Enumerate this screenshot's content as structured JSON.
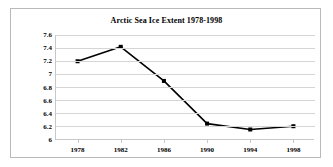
{
  "chart_data": {
    "type": "line",
    "title": "Arctic Sea Ice Extent 1978-1998",
    "xlabel": "",
    "ylabel": "",
    "x": [
      1978,
      1982,
      1986,
      1990,
      1994,
      1998
    ],
    "categories": [
      "1978",
      "1982",
      "1986",
      "1990",
      "1994",
      "1998"
    ],
    "values": [
      7.2,
      7.42,
      6.9,
      6.25,
      6.16,
      6.21
    ],
    "series": [
      {
        "name": "Arctic Sea Ice Extent",
        "values": [
          7.2,
          7.42,
          6.9,
          6.25,
          6.16,
          6.21
        ]
      }
    ],
    "ylim": [
      6.0,
      7.6
    ],
    "yticks": [
      6.0,
      6.2,
      6.4,
      6.6,
      6.8,
      7.0,
      7.2,
      7.4,
      7.6
    ],
    "ytick_labels": [
      "6",
      "6.2",
      "6.4",
      "6.6",
      "6.8",
      "7",
      "7.2",
      "7.4",
      "7.6"
    ],
    "xlim": [
      1976,
      2000
    ],
    "xticks": [
      1978,
      1982,
      1986,
      1990,
      1994,
      1998
    ],
    "xtick_labels": [
      "1978",
      "1982",
      "1986",
      "1990",
      "1994",
      "1998"
    ],
    "grid": "horizontal",
    "legend": "none",
    "marker": "square",
    "line_color": "#000000",
    "marker_color": "#000000",
    "gridline_color": "#d5d5d5",
    "axis_color": "#c8c8c8",
    "plot_background": "#ffffff",
    "frame_border_color": "#b9b9b9"
  }
}
